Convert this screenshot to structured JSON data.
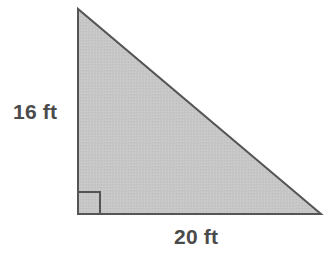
{
  "figure": {
    "kind": "right-triangle-diagram",
    "background_color": "#ffffff",
    "shape": {
      "name": "right-triangle",
      "fill_color": "#c6c6c6",
      "stroke_color": "#555555",
      "stroke_width": 2,
      "vertices": {
        "apex": [
          78,
          9
        ],
        "right_angle": [
          78,
          214
        ],
        "base_end": [
          321,
          214
        ]
      }
    },
    "right_angle_marker": {
      "name": "right-angle-marker",
      "size": 22,
      "stroke_color": "#555555",
      "stroke_width": 2
    },
    "labels": {
      "vertical_leg": "16 ft",
      "horizontal_leg": "20 ft",
      "text_color": "#4b4b4b"
    },
    "measurements": {
      "height_value": 16,
      "height_unit": "ft",
      "base_value": 20,
      "base_unit": "ft"
    }
  }
}
